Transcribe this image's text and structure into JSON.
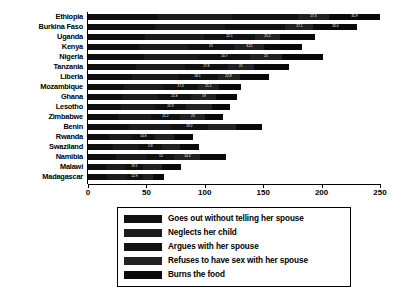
{
  "chart_data": {
    "type": "bar",
    "orientation": "horizontal",
    "stacked": true,
    "title": "",
    "subtitle": "",
    "xlabel": "",
    "ylabel": "",
    "xlim": [
      0,
      250
    ],
    "xticks": [
      0,
      50,
      100,
      150,
      200,
      250
    ],
    "grid": false,
    "legend_position": "bottom",
    "categories": [
      "Ethiopia",
      "Burkina Faso",
      "Uganda",
      "Kenya",
      "Nigeria",
      "Tanzania",
      "Liberia",
      "Mozambique",
      "Ghana",
      "Lesotho",
      "Zimbabwe",
      "Benin",
      "Rwanda",
      "Swaziland",
      "Namibia",
      "Malawi",
      "Madagascar"
    ],
    "series": [
      {
        "name": "Goes out without telling her spouse",
        "color": "#101010",
        "values": [
          61,
          57,
          49,
          44,
          48,
          41,
          38,
          31,
          29,
          28,
          26,
          35,
          18,
          21,
          24,
          15,
          16
        ]
      },
      {
        "name": "Neglects her child",
        "color": "#1c1c1c",
        "values": [
          64,
          60,
          50,
          42,
          47,
          42,
          39,
          33,
          31,
          29,
          28,
          36,
          20,
          22,
          26,
          17,
          17
        ]
      },
      {
        "name": "Argues with her spouse",
        "color": "#121212",
        "values": [
          57,
          52,
          44,
          39,
          44,
          37,
          34,
          30,
          28,
          27,
          25,
          32,
          19,
          20,
          24,
          15,
          14
        ]
      },
      {
        "name": "Refuses to have sex with her spouse",
        "color": "#222222",
        "values": [
          27,
          24,
          21,
          26,
          27,
          22,
          19,
          18,
          22,
          22,
          21,
          24,
          17,
          16,
          22,
          16,
          9
        ]
      },
      {
        "name": "Burns the food",
        "color": "#0a0a0a",
        "values": [
          44,
          37,
          30,
          32,
          35,
          30,
          25,
          19,
          18,
          16,
          16,
          22,
          16,
          16,
          22,
          17,
          9
        ]
      }
    ],
    "totals": [
      253,
      230,
      194,
      183,
      201,
      172,
      155,
      131,
      128,
      122,
      116,
      149,
      90,
      95,
      118,
      80,
      65
    ],
    "segment_labels": [
      [
        "",
        "",
        "",
        "27.3",
        "31.9"
      ],
      [
        "",
        "",
        "",
        "27.1",
        "32.0"
      ],
      [
        "",
        "",
        "22.1",
        "25.2",
        ""
      ],
      [
        "",
        "",
        "25",
        "3.21",
        ""
      ],
      [
        "",
        "",
        "20.7",
        "25",
        ""
      ],
      [
        "",
        "",
        "17.8",
        "21",
        ""
      ],
      [
        "",
        "",
        "18.1",
        "22.8",
        ""
      ],
      [
        "",
        "",
        "17.4",
        "21.1",
        ""
      ],
      [
        "",
        "",
        "21.8",
        "19",
        ""
      ],
      [
        "",
        "",
        "21.9",
        "",
        ""
      ],
      [
        "",
        "",
        "21.2",
        "23",
        ""
      ],
      [
        "",
        "",
        "19.2",
        "",
        ""
      ],
      [
        "",
        "",
        "10.8",
        "",
        ""
      ],
      [
        "",
        "",
        "2.8",
        "",
        ""
      ],
      [
        "",
        "",
        "12",
        "14.3",
        ""
      ],
      [
        "",
        "",
        "19.1",
        "",
        ""
      ],
      [
        "",
        "",
        "12.9",
        "",
        ""
      ]
    ]
  },
  "legend": {
    "items": [
      {
        "label": "Goes out without telling her spouse"
      },
      {
        "label": "Neglects her child"
      },
      {
        "label": "Argues with her spouse"
      },
      {
        "label": "Refuses to have sex with her spouse"
      },
      {
        "label": "Burns the food"
      }
    ]
  }
}
